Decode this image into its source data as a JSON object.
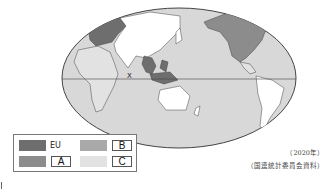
{
  "map": {
    "projection": "world map centered on Pacific",
    "marked_country_label": "X",
    "colors": {
      "ocean": "#d8d8d8",
      "eu": "#6e6e6e",
      "a": "#8c8c8c",
      "b": "#a9a9a9",
      "c": "#e2e2e2",
      "land_white": "#ffffff",
      "outline": "#444444"
    }
  },
  "legend": {
    "items": [
      {
        "key": "eu",
        "label": "EU"
      },
      {
        "key": "b",
        "label": "B"
      },
      {
        "key": "a",
        "label": "A"
      },
      {
        "key": "c",
        "label": "C"
      }
    ]
  },
  "source": {
    "year": "（2020年）",
    "citation": "（国連統計委員会資料）"
  }
}
